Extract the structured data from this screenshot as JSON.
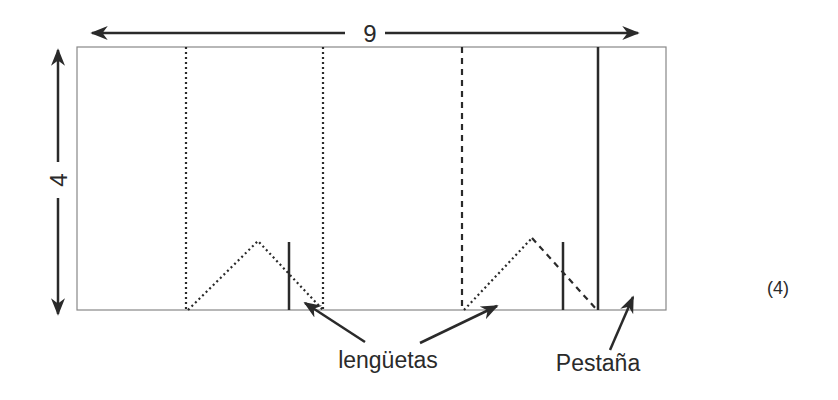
{
  "diagram": {
    "width_label": "9",
    "height_label": "4",
    "callouts": {
      "tabs": "lengüetas",
      "flap": "Pestaña"
    },
    "figure_number": "(4)",
    "colors": {
      "line": "#2a2a2a",
      "border": "#888888",
      "background": "#ffffff"
    }
  }
}
